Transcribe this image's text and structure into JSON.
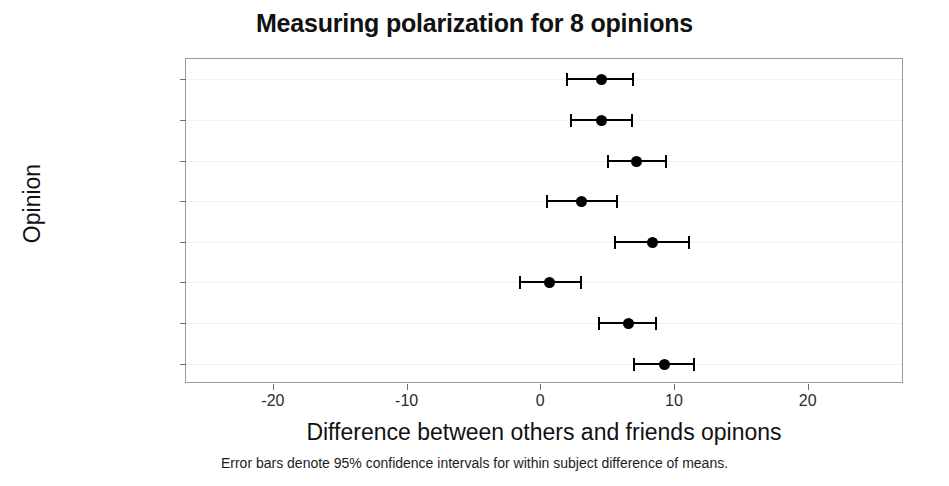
{
  "chart_data": {
    "type": "scatter",
    "title": "Measuring polarization for 8 opinions",
    "xlabel": "Difference between others and friends opinons",
    "ylabel": "Opinion",
    "footnote": "Error bars denote 95% confidence intervals for within subject difference of means.",
    "xlim": [
      -26.5,
      27.2
    ],
    "xticks": [
      -20,
      -10,
      0,
      10,
      20
    ],
    "xticklabels": [
      "-20",
      "-10",
      "0",
      "10",
      "20"
    ],
    "grid": "horizontal",
    "legend": "none",
    "error_bars": "95% confidence interval",
    "categories": [
      "womensrights",
      "russia",
      "leftdisconnect",
      "immigration2",
      "immigration",
      "demosoc",
      "afd2",
      "afd"
    ],
    "points": [
      {
        "category": "womensrights",
        "value": 4.6,
        "ci_low": 1.9,
        "ci_high": 7.0
      },
      {
        "category": "russia",
        "value": 4.6,
        "ci_low": 2.2,
        "ci_high": 6.9
      },
      {
        "category": "leftdisconnect",
        "value": 7.2,
        "ci_low": 5.0,
        "ci_high": 9.5
      },
      {
        "category": "immigration2",
        "value": 3.1,
        "ci_low": 0.4,
        "ci_high": 5.8
      },
      {
        "category": "immigration",
        "value": 8.4,
        "ci_low": 5.5,
        "ci_high": 11.2
      },
      {
        "category": "demosoc",
        "value": 0.7,
        "ci_low": -1.6,
        "ci_high": 3.1
      },
      {
        "category": "afd2",
        "value": 6.6,
        "ci_low": 4.3,
        "ci_high": 8.7
      },
      {
        "category": "afd",
        "value": 9.3,
        "ci_low": 6.9,
        "ci_high": 11.6
      }
    ],
    "colors": {
      "marker": "#000000",
      "errorbar": "#000000",
      "frame": "#9a9a9a",
      "gridline": "#f1f1f1",
      "text": "#111111",
      "background": "#ffffff"
    }
  }
}
